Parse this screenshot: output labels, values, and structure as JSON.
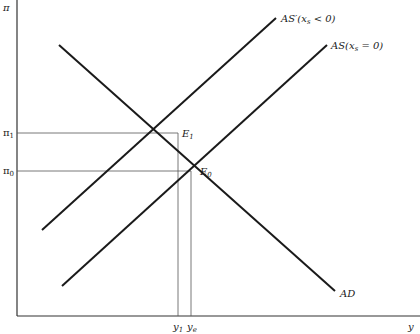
{
  "diagram": {
    "type": "economics AS-AD diagram",
    "axes": {
      "y_label": "π",
      "x_label": "y"
    },
    "curves": [
      {
        "id": "AD",
        "label": "AD",
        "x1": 59,
        "y1": 45,
        "x2": 335,
        "y2": 291
      },
      {
        "id": "AS_prime",
        "label": "AS′(xₛ < 0)",
        "label_main": "AS′(x",
        "label_sub": "s",
        "label_tail": " < 0)",
        "x1": 42,
        "y1": 230,
        "x2": 276,
        "y2": 18
      },
      {
        "id": "AS",
        "label": "AS(xₛ = 0)",
        "label_main": "AS(x",
        "label_sub": "s",
        "label_tail": " = 0)",
        "x1": 62,
        "y1": 286,
        "x2": 327,
        "y2": 45
      }
    ],
    "equilibria": [
      {
        "id": "E1",
        "label_main": "E",
        "label_sub": "1",
        "x": 178,
        "y": 133
      },
      {
        "id": "E0",
        "label_main": "E",
        "label_sub": "0",
        "x": 191,
        "y": 171
      }
    ],
    "y_ticks": [
      {
        "label_main": "π",
        "label_sub": "1",
        "y": 133
      },
      {
        "label_main": "π",
        "label_sub": "0",
        "y": 171
      }
    ],
    "x_ticks": [
      {
        "label_main": "y",
        "label_sub": "1",
        "x": 178
      },
      {
        "label_main": "y",
        "label_sub": "e",
        "x": 191
      }
    ],
    "colors": {
      "curve": "#1a1a1a",
      "axis": "#333333",
      "guide": "#555555"
    }
  }
}
